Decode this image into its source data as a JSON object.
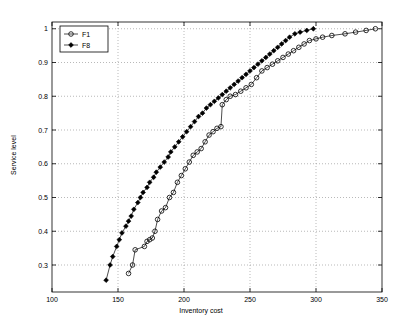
{
  "chart_data": {
    "type": "line",
    "title": "",
    "xlabel": "Inventory cost",
    "ylabel": "Service level",
    "xlim": [
      100,
      350
    ],
    "ylim": [
      0.22,
      1.02
    ],
    "xticks": [
      100,
      150,
      200,
      250,
      300,
      350
    ],
    "yticks": [
      0.3,
      0.4,
      0.5,
      0.6,
      0.7,
      0.8,
      0.9,
      1
    ],
    "ytick_labels": [
      "0.3",
      "0.4",
      "0.5",
      "0.6",
      "0.7",
      "0.8",
      "0.9",
      "1"
    ],
    "xtick_labels": [
      "100",
      "150",
      "200",
      "250",
      "300",
      "350"
    ],
    "grid": true,
    "legend_position": "top-left",
    "series": [
      {
        "name": "F1",
        "marker": "circle-open",
        "color": "#000000",
        "points": [
          [
            158,
            0.275
          ],
          [
            161,
            0.3
          ],
          [
            163,
            0.345
          ],
          [
            170,
            0.355
          ],
          [
            172,
            0.37
          ],
          [
            174,
            0.375
          ],
          [
            176,
            0.38
          ],
          [
            178,
            0.4
          ],
          [
            180,
            0.435
          ],
          [
            183,
            0.46
          ],
          [
            186,
            0.47
          ],
          [
            189,
            0.5
          ],
          [
            192,
            0.515
          ],
          [
            195,
            0.545
          ],
          [
            198,
            0.565
          ],
          [
            201,
            0.585
          ],
          [
            204,
            0.605
          ],
          [
            207,
            0.625
          ],
          [
            210,
            0.635
          ],
          [
            213,
            0.645
          ],
          [
            216,
            0.665
          ],
          [
            219,
            0.685
          ],
          [
            222,
            0.695
          ],
          [
            225,
            0.705
          ],
          [
            228,
            0.71
          ],
          [
            229,
            0.775
          ],
          [
            232,
            0.79
          ],
          [
            235,
            0.8
          ],
          [
            239,
            0.805
          ],
          [
            243,
            0.815
          ],
          [
            247,
            0.825
          ],
          [
            251,
            0.835
          ],
          [
            255,
            0.855
          ],
          [
            259,
            0.875
          ],
          [
            263,
            0.885
          ],
          [
            267,
            0.895
          ],
          [
            271,
            0.905
          ],
          [
            275,
            0.915
          ],
          [
            279,
            0.925
          ],
          [
            283,
            0.935
          ],
          [
            287,
            0.945
          ],
          [
            291,
            0.955
          ],
          [
            295,
            0.965
          ],
          [
            300,
            0.97
          ],
          [
            305,
            0.975
          ],
          [
            312,
            0.98
          ],
          [
            322,
            0.985
          ],
          [
            330,
            0.99
          ],
          [
            338,
            0.995
          ],
          [
            345,
            1.0
          ]
        ]
      },
      {
        "name": "F8",
        "marker": "diamond-filled",
        "color": "#000000",
        "points": [
          [
            141,
            0.255
          ],
          [
            144,
            0.3
          ],
          [
            146,
            0.325
          ],
          [
            149,
            0.355
          ],
          [
            151,
            0.375
          ],
          [
            153,
            0.395
          ],
          [
            156,
            0.415
          ],
          [
            158,
            0.43
          ],
          [
            160,
            0.445
          ],
          [
            162,
            0.465
          ],
          [
            165,
            0.485
          ],
          [
            167,
            0.5
          ],
          [
            169,
            0.515
          ],
          [
            172,
            0.53
          ],
          [
            174,
            0.545
          ],
          [
            177,
            0.56
          ],
          [
            179,
            0.575
          ],
          [
            182,
            0.59
          ],
          [
            185,
            0.605
          ],
          [
            188,
            0.62
          ],
          [
            190,
            0.635
          ],
          [
            193,
            0.65
          ],
          [
            196,
            0.665
          ],
          [
            199,
            0.68
          ],
          [
            202,
            0.695
          ],
          [
            205,
            0.71
          ],
          [
            208,
            0.725
          ],
          [
            211,
            0.74
          ],
          [
            214,
            0.75
          ],
          [
            217,
            0.765
          ],
          [
            220,
            0.775
          ],
          [
            223,
            0.785
          ],
          [
            226,
            0.795
          ],
          [
            229,
            0.805
          ],
          [
            232,
            0.815
          ],
          [
            235,
            0.825
          ],
          [
            238,
            0.835
          ],
          [
            241,
            0.845
          ],
          [
            244,
            0.855
          ],
          [
            247,
            0.865
          ],
          [
            250,
            0.875
          ],
          [
            253,
            0.885
          ],
          [
            256,
            0.895
          ],
          [
            259,
            0.905
          ],
          [
            262,
            0.915
          ],
          [
            265,
            0.925
          ],
          [
            268,
            0.935
          ],
          [
            271,
            0.945
          ],
          [
            274,
            0.955
          ],
          [
            277,
            0.965
          ],
          [
            280,
            0.975
          ],
          [
            284,
            0.985
          ],
          [
            288,
            0.99
          ],
          [
            293,
            0.995
          ],
          [
            298,
            1.0
          ]
        ]
      }
    ],
    "legend": [
      {
        "label": "F1",
        "marker": "circle-open"
      },
      {
        "label": "F8",
        "marker": "diamond-filled"
      }
    ]
  }
}
